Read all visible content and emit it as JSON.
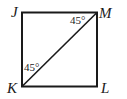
{
  "diagram": {
    "type": "square with diagonal",
    "vertices": [
      {
        "name": "J",
        "label": "J",
        "position": "top-left"
      },
      {
        "name": "M",
        "label": "M",
        "position": "top-right"
      },
      {
        "name": "K",
        "label": "K",
        "position": "bottom-left"
      },
      {
        "name": "L",
        "label": "L",
        "position": "bottom-right"
      }
    ],
    "diagonal": "KM",
    "angles": [
      {
        "vertex": "M",
        "label": "45°",
        "between": "JM and KM"
      },
      {
        "vertex": "K",
        "label": "45°",
        "between": "JK and KM"
      }
    ],
    "colors": {
      "stroke": "#1a1a1a",
      "background": "#ffffff"
    }
  }
}
